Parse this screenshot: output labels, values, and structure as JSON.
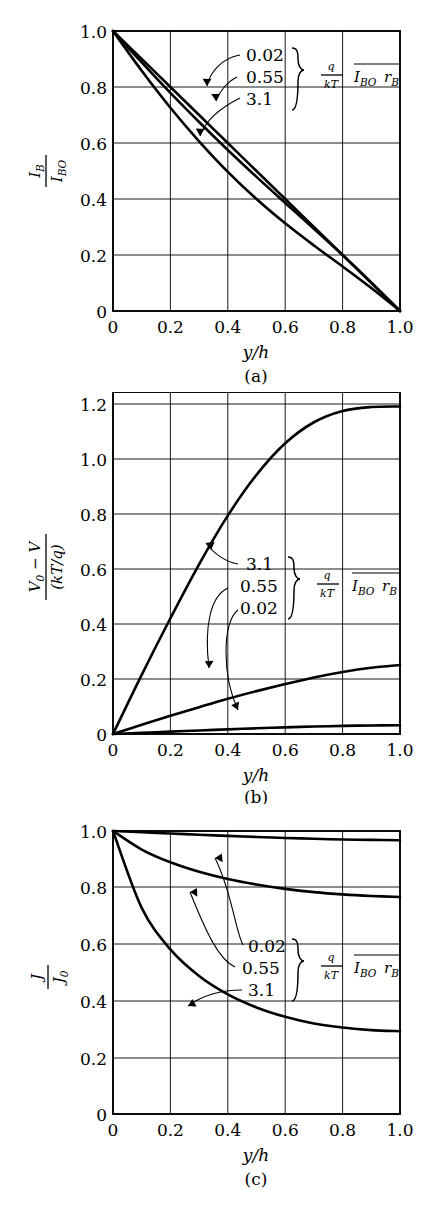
{
  "figure": {
    "panels": [
      {
        "id": "a",
        "caption": "(a)",
        "xlabel": "y/h",
        "ylabel_num": "I_B",
        "ylabel_den": "I_BO",
        "xticks": [
          "0",
          "0.2",
          "0.4",
          "0.6",
          "0.8",
          "1.0"
        ],
        "yticks": [
          "0",
          "0.2",
          "0.4",
          "0.6",
          "0.8",
          "1.0"
        ],
        "annot": {
          "values": [
            "0.02",
            "0.55",
            "3.1"
          ],
          "legend_num": "q",
          "legend_den": "kT",
          "legend_term1": "I",
          "legend_term1_sub": "BO",
          "legend_term2": "r",
          "legend_term2_sub": "B"
        }
      },
      {
        "id": "b",
        "caption": "(b)",
        "xlabel": "y/h",
        "ylabel_num": "V_0 − V",
        "ylabel_den": "(kT/q)",
        "xticks": [
          "0",
          "0.2",
          "0.4",
          "0.6",
          "0.8",
          "1.0"
        ],
        "yticks": [
          "0",
          "0.2",
          "0.4",
          "0.6",
          "0.8",
          "1.0",
          "1.2"
        ],
        "annot": {
          "values": [
            "3.1",
            "0.55",
            "0.02"
          ],
          "legend_num": "q",
          "legend_den": "kT",
          "legend_term1": "I",
          "legend_term1_sub": "BO",
          "legend_term2": "r",
          "legend_term2_sub": "B"
        }
      },
      {
        "id": "c",
        "caption": "(c)",
        "xlabel": "y/h",
        "ylabel_num": "J",
        "ylabel_den": "J_0",
        "xticks": [
          "0",
          "0.2",
          "0.4",
          "0.6",
          "0.8",
          "1.0"
        ],
        "yticks": [
          "0",
          "0.2",
          "0.4",
          "0.6",
          "0.8",
          "1.0"
        ],
        "annot": {
          "values": [
            "0.02",
            "0.55",
            "3.1"
          ],
          "legend_num": "q",
          "legend_den": "kT",
          "legend_term1": "I",
          "legend_term1_sub": "BO",
          "legend_term2": "r",
          "legend_term2_sub": "B"
        }
      }
    ]
  },
  "chart_data": [
    {
      "type": "line",
      "panel": "a",
      "title": "",
      "xlabel": "y/h",
      "ylabel": "I_B / I_BO",
      "xlim": [
        0,
        1.0
      ],
      "ylim": [
        0,
        1.0
      ],
      "xticks": [
        0,
        0.2,
        0.4,
        0.6,
        0.8,
        1.0
      ],
      "yticks": [
        0,
        0.2,
        0.4,
        0.6,
        0.8,
        1.0
      ],
      "grid": true,
      "legend_label": "q/kT I_BO r_B",
      "x": [
        0,
        0.1,
        0.2,
        0.3,
        0.4,
        0.5,
        0.6,
        0.7,
        0.8,
        0.9,
        1.0
      ],
      "series": [
        {
          "name": "0.02",
          "values": [
            1.0,
            0.9,
            0.8,
            0.7,
            0.6,
            0.5,
            0.4,
            0.3,
            0.2,
            0.1,
            0.0
          ]
        },
        {
          "name": "0.55",
          "values": [
            1.0,
            0.888,
            0.779,
            0.675,
            0.575,
            0.479,
            0.386,
            0.294,
            0.2,
            0.102,
            0.0
          ]
        },
        {
          "name": "3.1",
          "values": [
            1.0,
            0.858,
            0.726,
            0.606,
            0.497,
            0.4,
            0.313,
            0.234,
            0.159,
            0.082,
            0.0
          ]
        }
      ]
    },
    {
      "type": "line",
      "panel": "b",
      "title": "",
      "xlabel": "y/h",
      "ylabel": "(V_0 - V)/(kT/q)",
      "xlim": [
        0,
        1.0
      ],
      "ylim": [
        0,
        1.3
      ],
      "xticks": [
        0,
        0.2,
        0.4,
        0.6,
        0.8,
        1.0
      ],
      "yticks": [
        0,
        0.2,
        0.4,
        0.6,
        0.8,
        1.0,
        1.2
      ],
      "grid": true,
      "legend_label": "q/kT I_BO r_B",
      "x": [
        0,
        0.1,
        0.2,
        0.3,
        0.4,
        0.5,
        0.6,
        0.7,
        0.8,
        0.9,
        1.0
      ],
      "series": [
        {
          "name": "3.1",
          "values": [
            0.0,
            0.225,
            0.44,
            0.645,
            0.83,
            0.985,
            1.105,
            1.185,
            1.228,
            1.243,
            1.245
          ]
        },
        {
          "name": "0.55",
          "values": [
            0.0,
            0.035,
            0.069,
            0.102,
            0.134,
            0.163,
            0.19,
            0.215,
            0.236,
            0.252,
            0.262
          ]
        },
        {
          "name": "0.02",
          "values": [
            0.0,
            0.0046,
            0.0091,
            0.0135,
            0.0177,
            0.0216,
            0.0252,
            0.0283,
            0.0308,
            0.0325,
            0.0333
          ]
        }
      ]
    },
    {
      "type": "line",
      "panel": "c",
      "title": "",
      "xlabel": "y/h",
      "ylabel": "J / J_0",
      "xlim": [
        0,
        1.0
      ],
      "ylim": [
        0,
        1.0
      ],
      "xticks": [
        0,
        0.2,
        0.4,
        0.6,
        0.8,
        1.0
      ],
      "yticks": [
        0,
        0.2,
        0.4,
        0.6,
        0.8,
        1.0
      ],
      "grid": true,
      "legend_label": "q/kT I_BO r_B",
      "x": [
        0,
        0.1,
        0.2,
        0.3,
        0.4,
        0.5,
        0.6,
        0.7,
        0.8,
        0.9,
        1.0
      ],
      "series": [
        {
          "name": "0.02",
          "values": [
            1.0,
            0.9955,
            0.991,
            0.9868,
            0.9826,
            0.979,
            0.9755,
            0.9725,
            0.97,
            0.9685,
            0.9672
          ]
        },
        {
          "name": "0.55",
          "values": [
            1.0,
            0.9345,
            0.8895,
            0.856,
            0.8305,
            0.811,
            0.7955,
            0.784,
            0.776,
            0.7705,
            0.767
          ]
        },
        {
          "name": "3.1",
          "values": [
            1.0,
            0.7285,
            0.5815,
            0.4875,
            0.4225,
            0.3765,
            0.3435,
            0.32,
            0.3055,
            0.2965,
            0.2925
          ]
        }
      ]
    }
  ]
}
